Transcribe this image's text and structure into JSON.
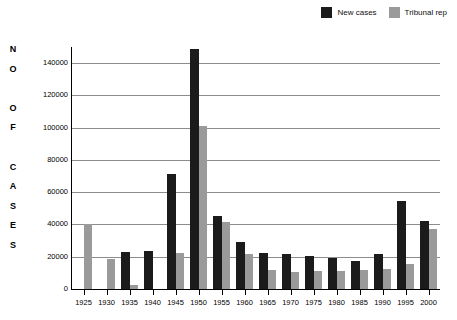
{
  "chart_data": {
    "type": "bar",
    "title": "",
    "xlabel": "",
    "ylabel": "NO OF CASES",
    "ylabel_letters": [
      "N",
      "O",
      "",
      "O",
      "F",
      "",
      "C",
      "A",
      "S",
      "E",
      "S"
    ],
    "ylim": [
      0,
      150000
    ],
    "yticks": [
      0,
      20000,
      40000,
      60000,
      80000,
      100000,
      120000,
      140000
    ],
    "ytick_labels": [
      "0",
      "20000",
      "40000",
      "60000",
      "80000",
      "100000",
      "120000",
      "140000"
    ],
    "grid": true,
    "legend_position": "top-right",
    "categories": [
      "1925",
      "1930",
      "1935",
      "1940",
      "1945",
      "1950",
      "1955",
      "1960",
      "1965",
      "1970",
      "1975",
      "1980",
      "1985",
      "1990",
      "1995",
      "2000"
    ],
    "series": [
      {
        "name": "New cases",
        "color": "#1b1b1b",
        "values": [
          0,
          0,
          23000,
          23400,
          71500,
          149000,
          45000,
          29000,
          22500,
          21500,
          20700,
          19200,
          17200,
          21700,
          54500,
          42300
        ]
      },
      {
        "name": "Tribunal rep",
        "color": "#9a9a9a",
        "values": [
          40400,
          18700,
          2500,
          0,
          22400,
          101000,
          41700,
          22000,
          11700,
          10600,
          11300,
          10900,
          11900,
          12600,
          15600,
          37500
        ]
      }
    ]
  },
  "legend": {
    "entries": [
      {
        "label": "New cases",
        "color": "#1b1b1b"
      },
      {
        "label": "Tribunal rep",
        "color": "#9a9a9a"
      }
    ]
  }
}
